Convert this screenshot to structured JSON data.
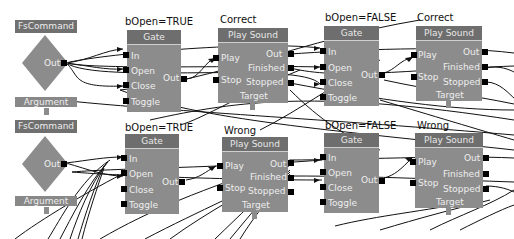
{
  "editor": {
    "background_color": "#ffffff",
    "node_color": "#8c8c8c",
    "header_color": "#6e6e6e",
    "pin_color": "#000000"
  },
  "rows": [
    {
      "fscommand": {
        "label": "FsCommand",
        "out_label": "Out",
        "argument_label": "Argument"
      },
      "gate1": {
        "title": "bOpen=TRUE",
        "header": "Gate",
        "inputs": [
          "In",
          "Open",
          "Close",
          "Toggle"
        ],
        "output": "Out"
      },
      "sound1": {
        "title": "Correct",
        "header": "Play Sound",
        "inputs": [
          "Play",
          "Stop"
        ],
        "outputs": [
          "Out",
          "Finished",
          "Stopped"
        ],
        "target": "Target"
      },
      "gate2": {
        "title": "bOpen=FALSE",
        "header": "Gate",
        "inputs": [
          "In",
          "Open",
          "Close",
          "Toggle"
        ],
        "output": "Out"
      },
      "sound2": {
        "title": "Correct",
        "header": "Play Sound",
        "inputs": [
          "Play",
          "Stop"
        ],
        "outputs": [
          "Out",
          "Finished",
          "Stopped"
        ],
        "target": "Target"
      }
    },
    {
      "fscommand": {
        "label": "FsCommand",
        "out_label": "Out",
        "argument_label": "Argument"
      },
      "gate1": {
        "title": "bOpen=TRUE",
        "header": "Gate",
        "inputs": [
          "In",
          "Open",
          "Close",
          "Toggle"
        ],
        "output": "Out"
      },
      "sound1": {
        "title": "Wrong",
        "header": "Play Sound",
        "inputs": [
          "Play",
          "Stop"
        ],
        "outputs": [
          "Out",
          "Finished",
          "Stopped"
        ],
        "target": "Target"
      },
      "gate2": {
        "title": "bOpen=FALSE",
        "header": "Gate",
        "inputs": [
          "In",
          "Open",
          "Close",
          "Toggle"
        ],
        "output": "Out"
      },
      "sound2": {
        "title": "Wrong",
        "header": "Play Sound",
        "inputs": [
          "Play",
          "Stop"
        ],
        "outputs": [
          "Out",
          "Finished",
          "Stopped"
        ],
        "target": "Target"
      }
    }
  ]
}
